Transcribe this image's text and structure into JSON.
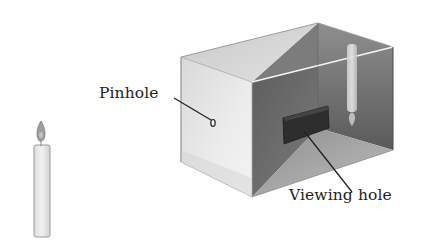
{
  "diagram": {
    "labels": {
      "pinhole": "Pinhole",
      "viewing_hole": "Viewing hole"
    },
    "objects": [
      {
        "name": "candle",
        "description": "upright lit candle outside the box"
      },
      {
        "name": "box",
        "description": "cut-away box with pinhole on left face"
      },
      {
        "name": "inverted-candle-image",
        "description": "upside-down candle image projected on back wall"
      },
      {
        "name": "viewing-hole",
        "description": "dark rectangular opening on inner wall"
      }
    ],
    "colors": {
      "background": "#ffffff",
      "left_face": "#e4e4e4",
      "top_face": "#d2d2d2",
      "back_wall": "#6e6e6e",
      "right_wall": "#8a8a8a",
      "floor": "#a9a9a9",
      "viewing_hole": "#2e2e2e",
      "candle_body": "#e8e8e8",
      "candle_flame": "#9a9a9a",
      "text": "#222222",
      "leader_line": "#222222"
    }
  }
}
